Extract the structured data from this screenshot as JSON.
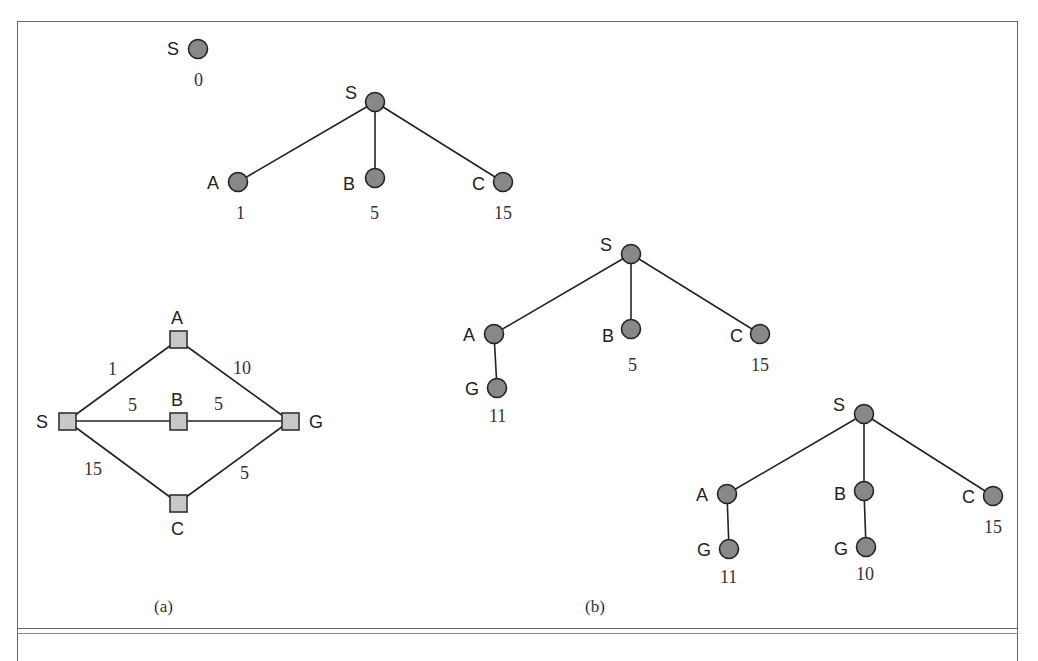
{
  "figure": {
    "caption_a": "(a)",
    "caption_b": "(b)",
    "colors": {
      "node_fill": "#888888",
      "square_fill": "#c8c8c8",
      "stroke": "#222222"
    }
  },
  "graph_a": {
    "nodes": [
      {
        "id": "A",
        "label": "A"
      },
      {
        "id": "S",
        "label": "S"
      },
      {
        "id": "B",
        "label": "B"
      },
      {
        "id": "G",
        "label": "G"
      },
      {
        "id": "C",
        "label": "C"
      }
    ],
    "edges": [
      {
        "from": "S",
        "to": "A",
        "weight": "1"
      },
      {
        "from": "A",
        "to": "G",
        "weight": "10"
      },
      {
        "from": "S",
        "to": "B",
        "weight": "5"
      },
      {
        "from": "B",
        "to": "G",
        "weight": "5"
      },
      {
        "from": "S",
        "to": "C",
        "weight": "15"
      },
      {
        "from": "C",
        "to": "G",
        "weight": "5"
      }
    ]
  },
  "trees": [
    {
      "root": {
        "label": "S",
        "cost": "0"
      }
    },
    {
      "root": {
        "label": "S"
      },
      "children": [
        {
          "label": "A",
          "cost": "1"
        },
        {
          "label": "B",
          "cost": "5"
        },
        {
          "label": "C",
          "cost": "15"
        }
      ]
    },
    {
      "root": {
        "label": "S"
      },
      "children": [
        {
          "label": "A",
          "children": [
            {
              "label": "G",
              "cost": "11"
            }
          ]
        },
        {
          "label": "B",
          "cost": "5"
        },
        {
          "label": "C",
          "cost": "15"
        }
      ]
    },
    {
      "root": {
        "label": "S"
      },
      "children": [
        {
          "label": "A",
          "children": [
            {
              "label": "G",
              "cost": "11"
            }
          ]
        },
        {
          "label": "B",
          "children": [
            {
              "label": "G",
              "cost": "10"
            }
          ]
        },
        {
          "label": "C",
          "cost": "15"
        }
      ]
    }
  ]
}
